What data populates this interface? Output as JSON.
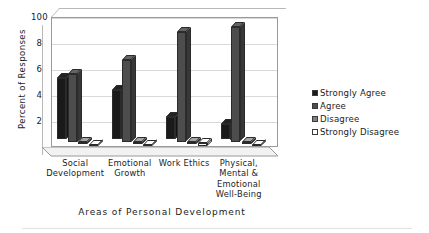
{
  "chart_data": {
    "type": "bar",
    "title": "",
    "subtitle": "",
    "xlabel": "Areas of Personal Development",
    "ylabel": "Percent of Responses",
    "ylim": [
      0,
      100
    ],
    "yticks": [
      100,
      80,
      60,
      40,
      20,
      0
    ],
    "grid": true,
    "legend_position": "right",
    "style": "3d-clustered-column",
    "categories": [
      "Social Development",
      "Emotional Growth",
      "Work Ethics",
      "Physical, Mental & Emotional Well-Being"
    ],
    "category_lines": [
      [
        "Social",
        "Development"
      ],
      [
        "Emotional",
        "Growth"
      ],
      [
        "Work Ethics"
      ],
      [
        "Physical,",
        "Mental &",
        "Emotional",
        "Well-Being"
      ]
    ],
    "series": [
      {
        "name": "Strongly Agree",
        "color": "#1a1a1a",
        "values": [
          47,
          38,
          17,
          12
        ]
      },
      {
        "name": "Agree",
        "color": "#4d4d4d",
        "values": [
          52,
          63,
          84,
          88
        ]
      },
      {
        "name": "Disagree",
        "color": "#808080",
        "values": [
          1,
          1,
          1,
          1
        ]
      },
      {
        "name": "Strongly Disagree",
        "color": "#ffffff",
        "values": [
          1,
          1,
          2,
          1
        ]
      }
    ]
  },
  "legend": {
    "items": [
      {
        "label": "Strongly Agree",
        "color": "#1a1a1a"
      },
      {
        "label": "Agree",
        "color": "#4d4d4d"
      },
      {
        "label": "Disagree",
        "color": "#808080"
      },
      {
        "label": "Strongly Disagree",
        "color": "#ffffff"
      }
    ]
  },
  "axes": {
    "y_title": "Percent of Responses",
    "x_title": "Areas of Personal Development",
    "y_tick_labels": [
      "100",
      "80",
      "60",
      "40",
      "20",
      "0"
    ]
  }
}
